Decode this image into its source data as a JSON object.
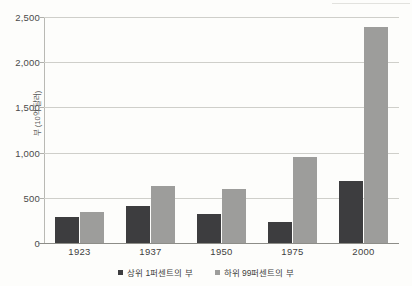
{
  "chart_data": {
    "type": "bar",
    "title": "",
    "subtitle": "",
    "xlabel": "",
    "ylabel": "부 (10억 달러)",
    "categories": [
      "1923",
      "1937",
      "1950",
      "1975",
      "2000"
    ],
    "series": [
      {
        "name": "상위 1퍼센트의 부",
        "color": "#3d3d3f",
        "values": [
          290,
          410,
          320,
          230,
          685
        ]
      },
      {
        "name": "하위 99퍼센트의 부",
        "color": "#9d9d9b",
        "values": [
          345,
          630,
          600,
          955,
          2385
        ]
      }
    ],
    "ylim": [
      0,
      2500
    ],
    "yticks": [
      0,
      500,
      1000,
      1500,
      2000,
      2500
    ],
    "ytick_labels": [
      "0",
      "500",
      "1,000",
      "1,500",
      "2,000",
      "2,500"
    ],
    "grid": true,
    "legend_position": "bottom"
  },
  "axis": {
    "y_title": "부 (10억 달러)",
    "y_tick_0": "0",
    "y_tick_1": "500",
    "y_tick_2": "1,000",
    "y_tick_3": "1,500",
    "y_tick_4": "2,000",
    "y_tick_5": "2,500",
    "x_tick_0": "1923",
    "x_tick_1": "1937",
    "x_tick_2": "1950",
    "x_tick_3": "1975",
    "x_tick_4": "2000"
  },
  "legend": {
    "items": [
      {
        "label": "상위 1퍼센트의 부",
        "color": "#3d3d3f"
      },
      {
        "label": "하위 99퍼센트의 부",
        "color": "#9d9d9b"
      }
    ]
  },
  "colors": {
    "series_dark": "#3d3d3f",
    "series_light": "#9d9d9b",
    "gridline": "#cfcfca",
    "axis": "#8d8d88",
    "background": "#fdfdfb"
  }
}
